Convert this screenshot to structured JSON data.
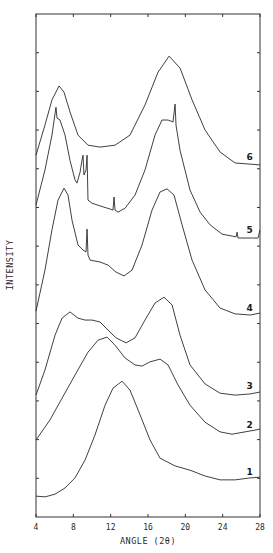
{
  "chart_data": {
    "type": "line",
    "title": "",
    "xlabel": "ANGLE (2θ)",
    "ylabel": "INTENSITY",
    "xlim": [
      4,
      28
    ],
    "ylim": [
      0,
      13
    ],
    "x_ticks": [
      4,
      8,
      12,
      16,
      20,
      24,
      28
    ],
    "y_tick_count": 13,
    "y_tick_labels_shown": false,
    "grid": false,
    "legend": "inline numeric labels at right end of each curve",
    "series": [
      {
        "name": "1",
        "label_pos": [
          26.9,
          1.16
        ],
        "points": [
          [
            4.0,
            0.54
          ],
          [
            4.96,
            0.52
          ],
          [
            6.04,
            0.59
          ],
          [
            7.11,
            0.75
          ],
          [
            8.18,
            1.01
          ],
          [
            9.25,
            1.47
          ],
          [
            10.32,
            2.12
          ],
          [
            11.4,
            2.89
          ],
          [
            12.25,
            3.33
          ],
          [
            13.22,
            3.51
          ],
          [
            14.07,
            3.28
          ],
          [
            15.15,
            2.64
          ],
          [
            16.22,
            1.99
          ],
          [
            17.29,
            1.52
          ],
          [
            18.9,
            1.32
          ],
          [
            20.5,
            1.21
          ],
          [
            22.11,
            1.06
          ],
          [
            23.72,
            0.96
          ],
          [
            25.33,
            0.96
          ],
          [
            26.94,
            1.01
          ],
          [
            28.0,
            1.03
          ]
        ]
      },
      {
        "name": "2",
        "label_pos": [
          26.9,
          2.38
        ],
        "points": [
          [
            4.0,
            1.99
          ],
          [
            5.5,
            2.51
          ],
          [
            6.79,
            3.07
          ],
          [
            8.18,
            3.67
          ],
          [
            9.57,
            4.26
          ],
          [
            10.65,
            4.57
          ],
          [
            11.61,
            4.65
          ],
          [
            12.47,
            4.44
          ],
          [
            13.54,
            4.11
          ],
          [
            14.61,
            3.93
          ],
          [
            15.36,
            3.9
          ],
          [
            16.22,
            4.01
          ],
          [
            17.29,
            4.08
          ],
          [
            18.15,
            3.93
          ],
          [
            19.22,
            3.41
          ],
          [
            20.5,
            2.89
          ],
          [
            22.11,
            2.45
          ],
          [
            23.72,
            2.2
          ],
          [
            25.0,
            2.14
          ],
          [
            26.4,
            2.2
          ],
          [
            28.0,
            2.27
          ]
        ]
      },
      {
        "name": "3",
        "label_pos": [
          26.9,
          3.39
        ],
        "points": [
          [
            4.0,
            3.15
          ],
          [
            4.96,
            3.8
          ],
          [
            6.04,
            4.7
          ],
          [
            6.79,
            5.14
          ],
          [
            7.64,
            5.3
          ],
          [
            8.5,
            5.14
          ],
          [
            9.25,
            5.09
          ],
          [
            10.0,
            5.09
          ],
          [
            10.86,
            5.04
          ],
          [
            11.72,
            4.83
          ],
          [
            12.57,
            4.63
          ],
          [
            13.65,
            4.5
          ],
          [
            14.61,
            4.63
          ],
          [
            15.68,
            5.09
          ],
          [
            16.75,
            5.53
          ],
          [
            17.72,
            5.68
          ],
          [
            18.58,
            5.48
          ],
          [
            19.43,
            4.7
          ],
          [
            20.5,
            3.93
          ],
          [
            22.11,
            3.44
          ],
          [
            23.72,
            3.2
          ],
          [
            25.33,
            3.15
          ],
          [
            26.94,
            3.18
          ],
          [
            28.0,
            3.23
          ]
        ]
      },
      {
        "name": "4",
        "label_pos": [
          26.9,
          5.4
        ],
        "points": [
          [
            4.0,
            5.32
          ],
          [
            4.96,
            6.38
          ],
          [
            5.71,
            7.42
          ],
          [
            6.36,
            8.19
          ],
          [
            7.0,
            8.5
          ],
          [
            7.43,
            8.32
          ],
          [
            7.86,
            7.67
          ],
          [
            8.5,
            7.03
          ],
          [
            9.04,
            6.9
          ],
          [
            9.36,
            6.85
          ],
          [
            9.47,
            7.44
          ],
          [
            9.57,
            6.77
          ],
          [
            9.79,
            6.64
          ],
          [
            10.86,
            6.59
          ],
          [
            11.72,
            6.51
          ],
          [
            12.57,
            6.33
          ],
          [
            13.43,
            6.23
          ],
          [
            14.29,
            6.38
          ],
          [
            15.36,
            7.03
          ],
          [
            16.43,
            7.93
          ],
          [
            17.29,
            8.4
          ],
          [
            18.04,
            8.48
          ],
          [
            18.79,
            8.32
          ],
          [
            19.65,
            7.55
          ],
          [
            20.72,
            6.64
          ],
          [
            22.11,
            5.87
          ],
          [
            23.72,
            5.4
          ],
          [
            25.33,
            5.25
          ],
          [
            26.94,
            5.22
          ],
          [
            28.0,
            5.27
          ]
        ]
      },
      {
        "name": "5",
        "label_pos": [
          26.9,
          7.42
        ],
        "points": [
          [
            4.0,
            8.06
          ],
          [
            4.96,
            8.97
          ],
          [
            5.71,
            9.87
          ],
          [
            6.14,
            10.59
          ],
          [
            6.25,
            10.31
          ],
          [
            6.57,
            10.26
          ],
          [
            7.11,
            9.87
          ],
          [
            7.64,
            9.22
          ],
          [
            8.18,
            8.71
          ],
          [
            8.39,
            8.63
          ],
          [
            8.72,
            8.91
          ],
          [
            8.93,
            9.22
          ],
          [
            9.04,
            9.35
          ],
          [
            9.14,
            8.84
          ],
          [
            9.36,
            8.97
          ],
          [
            9.47,
            9.35
          ],
          [
            9.57,
            8.19
          ],
          [
            10.0,
            8.11
          ],
          [
            10.86,
            8.04
          ],
          [
            11.93,
            7.96
          ],
          [
            12.25,
            7.93
          ],
          [
            12.36,
            8.27
          ],
          [
            12.47,
            7.93
          ],
          [
            12.79,
            7.88
          ],
          [
            13.54,
            7.98
          ],
          [
            14.61,
            8.32
          ],
          [
            15.68,
            8.97
          ],
          [
            16.75,
            9.87
          ],
          [
            17.5,
            10.26
          ],
          [
            18.15,
            10.26
          ],
          [
            18.68,
            10.21
          ],
          [
            18.9,
            10.67
          ],
          [
            19.0,
            10.13
          ],
          [
            19.43,
            9.48
          ],
          [
            20.5,
            8.45
          ],
          [
            21.58,
            7.88
          ],
          [
            22.65,
            7.55
          ],
          [
            23.94,
            7.31
          ],
          [
            25.44,
            7.24
          ],
          [
            25.54,
            7.36
          ],
          [
            25.65,
            7.21
          ],
          [
            26.94,
            7.21
          ],
          [
            27.79,
            7.21
          ],
          [
            28.0,
            7.42
          ]
        ]
      },
      {
        "name": "6",
        "label_pos": [
          26.9,
          9.3
        ],
        "points": [
          [
            4.0,
            9.35
          ],
          [
            4.96,
            10.13
          ],
          [
            5.71,
            10.78
          ],
          [
            6.47,
            11.14
          ],
          [
            7.0,
            10.98
          ],
          [
            7.64,
            10.47
          ],
          [
            8.5,
            9.87
          ],
          [
            9.57,
            9.61
          ],
          [
            10.86,
            9.56
          ],
          [
            12.47,
            9.61
          ],
          [
            14.07,
            9.87
          ],
          [
            15.68,
            10.65
          ],
          [
            17.08,
            11.5
          ],
          [
            18.26,
            11.91
          ],
          [
            19.44,
            11.6
          ],
          [
            20.72,
            10.78
          ],
          [
            22.12,
            10.0
          ],
          [
            23.73,
            9.43
          ],
          [
            25.33,
            9.15
          ],
          [
            28.0,
            9.1
          ]
        ]
      }
    ]
  },
  "axes": {
    "x_tick_labels": [
      "4",
      "8",
      "12",
      "16",
      "20",
      "24",
      "28"
    ],
    "xlabel": "ANGLE (2θ)",
    "ylabel": "INTENSITY"
  },
  "colors": {
    "line": "#2a2a2a",
    "background": "#ffffff"
  }
}
